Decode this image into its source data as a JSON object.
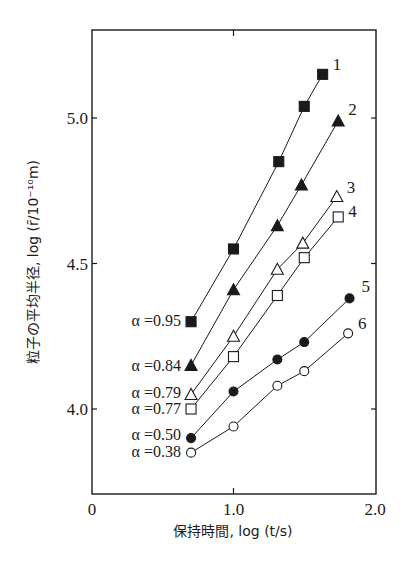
{
  "chart_data": {
    "type": "line",
    "title": "",
    "xlabel": "保持時間, log (t/s)",
    "ylabel": "粒子の平均半径, log (r̄/10⁻¹⁰m)",
    "xlim": [
      0,
      2.0
    ],
    "ylim": [
      3.72,
      5.32
    ],
    "x_ticks": [
      0,
      1.0,
      2.0
    ],
    "x_tick_labels": [
      "0",
      "1.0",
      "2.0"
    ],
    "y_ticks": [
      4.0,
      4.5,
      5.0
    ],
    "y_tick_labels": [
      "4.0",
      "4.5",
      "5.0"
    ],
    "grid": false,
    "legend_position": "inline labels (series numbers at line ends, α values at line starts)",
    "series": [
      {
        "name": "1",
        "alpha_label": "α =0.95",
        "marker": "filled-square",
        "x": [
          0.7,
          1.0,
          1.32,
          1.5,
          1.63
        ],
        "y": [
          4.3,
          4.55,
          4.85,
          5.04,
          5.15
        ]
      },
      {
        "name": "2",
        "alpha_label": "α =0.84",
        "marker": "filled-triangle",
        "x": [
          0.7,
          1.0,
          1.31,
          1.48,
          1.74
        ],
        "y": [
          4.15,
          4.41,
          4.63,
          4.77,
          4.99
        ]
      },
      {
        "name": "3",
        "alpha_label": "α =0.79",
        "marker": "open-triangle",
        "x": [
          0.7,
          1.0,
          1.31,
          1.49,
          1.73
        ],
        "y": [
          4.05,
          4.25,
          4.48,
          4.57,
          4.73
        ]
      },
      {
        "name": "4",
        "alpha_label": "α =0.77",
        "marker": "open-square",
        "x": [
          0.7,
          1.0,
          1.31,
          1.5,
          1.74
        ],
        "y": [
          4.0,
          4.18,
          4.39,
          4.52,
          4.66
        ]
      },
      {
        "name": "5",
        "alpha_label": "α =0.50",
        "marker": "filled-circle",
        "x": [
          0.7,
          1.0,
          1.31,
          1.5,
          1.82
        ],
        "y": [
          3.9,
          4.06,
          4.17,
          4.23,
          4.38
        ]
      },
      {
        "name": "6",
        "alpha_label": "α =0.38",
        "marker": "open-circle",
        "x": [
          0.7,
          1.0,
          1.31,
          1.5,
          1.81
        ],
        "y": [
          3.85,
          3.94,
          4.08,
          4.13,
          4.26
        ]
      }
    ]
  },
  "labels": {
    "x_title": "保持時間,  log (t/s)",
    "y_title": "粒子の平均半径, log (r̄/10⁻¹⁰m)"
  },
  "colors": {
    "ink": "#1a1a1a",
    "background": "#ffffff"
  }
}
